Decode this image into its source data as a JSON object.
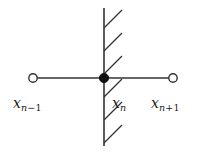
{
  "figure": {
    "kind": "number-line-stencil-diagram",
    "background_color": "#ffffff",
    "stroke_color": "#333333",
    "text_color": "#1a1a1a"
  },
  "labels": {
    "left": {
      "base": "x",
      "sub_var": "n",
      "sub_op": "−",
      "sub_num": "1"
    },
    "center": {
      "base": "x",
      "sub_var": "n",
      "sub_op": "",
      "sub_num": ""
    },
    "right": {
      "base": "x",
      "sub_var": "n",
      "sub_op": "+",
      "sub_num": "1"
    }
  },
  "geometry": {
    "horizontal_line": {
      "x1": 33,
      "y1": 78,
      "x2": 173,
      "y2": 78
    },
    "vertical_line": {
      "x1": 104,
      "y1": 8,
      "x2": 104,
      "y2": 146
    },
    "open_node_left": {
      "cx": 33,
      "cy": 78,
      "r": 4.2
    },
    "open_node_right": {
      "cx": 173,
      "cy": 78,
      "r": 4.2
    },
    "filled_node": {
      "cx": 104,
      "cy": 78,
      "r": 4.6
    },
    "hatch_marks": [
      {
        "x1": 104,
        "y1": 28,
        "x2": 122,
        "y2": 10
      },
      {
        "x1": 104,
        "y1": 51,
        "x2": 122,
        "y2": 33
      },
      {
        "x1": 104,
        "y1": 74,
        "x2": 122,
        "y2": 56
      },
      {
        "x1": 104,
        "y1": 97,
        "x2": 122,
        "y2": 79
      },
      {
        "x1": 104,
        "y1": 120,
        "x2": 122,
        "y2": 102
      },
      {
        "x1": 104,
        "y1": 143,
        "x2": 122,
        "y2": 125
      }
    ]
  }
}
